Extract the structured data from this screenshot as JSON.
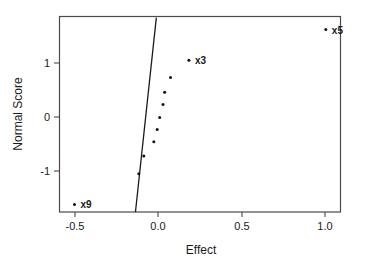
{
  "chart_data": {
    "type": "scatter",
    "title": "",
    "xlabel": "Effect",
    "ylabel": "Normal Score",
    "xlim": [
      -0.62,
      1.07
    ],
    "ylim": [
      -1.81,
      1.85
    ],
    "xticks": [
      -0.5,
      0.0,
      0.5,
      1.0
    ],
    "xtick_labels": [
      "-0.5",
      "0.0",
      "0.5",
      "1.0"
    ],
    "yticks": [
      1,
      0,
      -1
    ],
    "ytick_labels": [
      "1",
      "0",
      "-1"
    ],
    "grid": false,
    "legend": "none",
    "series": [
      {
        "name": "effects",
        "points": [
          {
            "x": -0.5,
            "y": -1.62,
            "label": "x9"
          },
          {
            "x": -0.115,
            "y": -1.05,
            "label": ""
          },
          {
            "x": -0.085,
            "y": -0.72,
            "label": ""
          },
          {
            "x": -0.025,
            "y": -0.46,
            "label": ""
          },
          {
            "x": -0.005,
            "y": -0.23,
            "label": ""
          },
          {
            "x": 0.01,
            "y": -0.01,
            "label": ""
          },
          {
            "x": 0.03,
            "y": 0.23,
            "label": ""
          },
          {
            "x": 0.04,
            "y": 0.46,
            "label": ""
          },
          {
            "x": 0.075,
            "y": 0.73,
            "label": ""
          },
          {
            "x": 0.185,
            "y": 1.05,
            "label": "x3"
          },
          {
            "x": 1.005,
            "y": 1.62,
            "label": "x5"
          }
        ]
      }
    ],
    "reference_line": {
      "name": "normal-fit-line",
      "x_start": -0.135,
      "y_start": -1.76,
      "x_end": -0.01,
      "y_end": 1.84
    },
    "point_labels": [
      "x9",
      "x3",
      "x5"
    ],
    "colors": {
      "point": "#111111",
      "line": "#1a1a1a",
      "frame": "#4a4a4a",
      "background": "#ffffff",
      "text": "#1a1a1a"
    }
  }
}
